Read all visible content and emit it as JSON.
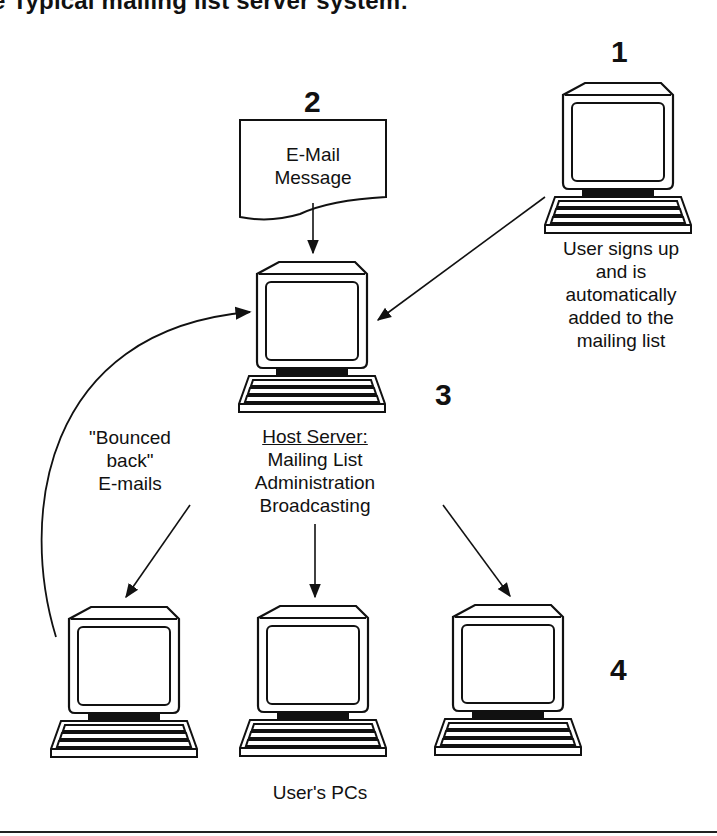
{
  "title": "e Typical mailing list server system:",
  "steps": {
    "step1": "1",
    "step2": "2",
    "step3": "3",
    "step4": "4"
  },
  "email_doc": {
    "line1": "E-Mail",
    "line2": "Message"
  },
  "subscriber": {
    "line1": "User signs up",
    "line2": "and is",
    "line3": "automatically",
    "line4": "added to the",
    "line5": "mailing list"
  },
  "server": {
    "heading": "Host Server:",
    "line1": "Mailing List",
    "line2": "Administration",
    "line3": "Broadcasting"
  },
  "bounce": {
    "line1": "\"Bounced",
    "line2": "back\"",
    "line3": "E-mails"
  },
  "users_label": "User's PCs",
  "colors": {
    "ink": "#111111",
    "background": "#ffffff"
  }
}
